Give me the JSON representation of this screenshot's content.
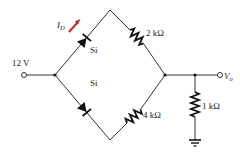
{
  "circuit": {
    "source": {
      "label": "12 V",
      "value_volts": 12
    },
    "diodes": [
      {
        "id": "D1",
        "position": "upper-left",
        "material": "Si",
        "label": "Si"
      },
      {
        "id": "D2",
        "position": "lower-left",
        "material": "Si",
        "label": "Si"
      }
    ],
    "resistors": [
      {
        "id": "R1",
        "position": "upper-right",
        "label": "2 kΩ",
        "value_ohms": 2000
      },
      {
        "id": "R2",
        "position": "lower-right",
        "label": "4 kΩ",
        "value_ohms": 4000
      },
      {
        "id": "R3",
        "position": "output-shunt",
        "label": "1 kΩ",
        "value_ohms": 1000
      }
    ],
    "current": {
      "label_main": "I",
      "label_sub": "D"
    },
    "output": {
      "label_main": "V",
      "label_sub": "o"
    },
    "colors": {
      "wire": "#333333",
      "component": "#111111",
      "current_arrow": "#c62828",
      "text": "#222222"
    }
  }
}
